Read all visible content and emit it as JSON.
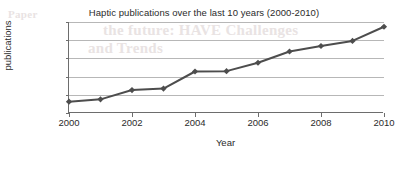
{
  "chart_data": {
    "type": "line",
    "title": "Haptic publications over the last 10 years (2000-2010)",
    "xlabel": "Year",
    "ylabel": "Number of publications",
    "x": [
      2000,
      2001,
      2002,
      2003,
      2004,
      2005,
      2006,
      2007,
      2008,
      2009,
      2010
    ],
    "values": [
      310,
      375,
      630,
      670,
      1140,
      1150,
      1380,
      1690,
      1840,
      1980,
      2370
    ],
    "series": [
      {
        "name": "Haptic publications",
        "values": [
          310,
          375,
          630,
          670,
          1140,
          1150,
          1380,
          1690,
          1840,
          1980,
          2370
        ]
      }
    ],
    "xlim": [
      2000,
      2010
    ],
    "ylim": [
      0,
      2500
    ],
    "xticks": [
      2000,
      2002,
      2004,
      2006,
      2008,
      2010
    ],
    "xtick_labels": [
      "2000",
      "2002",
      "2004",
      "2006",
      "2008",
      "2010"
    ],
    "yticks": [
      0,
      500,
      1000,
      1500,
      2000,
      2500
    ],
    "ytick_labels": [
      "0",
      "500",
      "1000",
      "1500",
      "2000",
      "2500"
    ],
    "grid": "horizontal",
    "legend": "none",
    "marker": "diamond",
    "line_color": "#4d4d4d",
    "marker_color": "#4d4d4d",
    "grid_color": "#b7b7b7",
    "axis_color": "#6d6d6d",
    "background_color": "#ffffff"
  },
  "artifacts": {
    "ghost_line_1": "the future: HAVE Challenges",
    "ghost_line_2": "and Trends",
    "ghost_line_3": "Paper"
  }
}
